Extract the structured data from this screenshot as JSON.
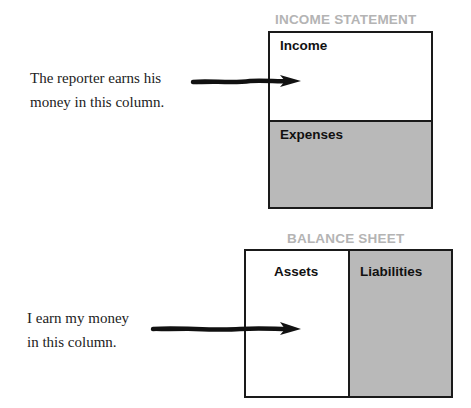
{
  "income_statement": {
    "title": "INCOME STATEMENT",
    "rows": [
      {
        "label": "Income",
        "fill": "#ffffff"
      },
      {
        "label": "Expenses",
        "fill": "#b9b9b9"
      }
    ]
  },
  "balance_sheet": {
    "title": "BALANCE SHEET",
    "columns": [
      {
        "label": "Assets",
        "fill": "#ffffff"
      },
      {
        "label": "Liabilities",
        "fill": "#b9b9b9"
      }
    ]
  },
  "annotations": [
    {
      "line1": "The reporter earns his",
      "line2": "money in this column.",
      "points_to": "Income"
    },
    {
      "line1": "I earn my money",
      "line2": "in this column.",
      "points_to": "Assets"
    }
  ],
  "colors": {
    "border": "#1a1a1a",
    "shaded": "#b9b9b9",
    "title_gray": "#b4b4b4"
  }
}
